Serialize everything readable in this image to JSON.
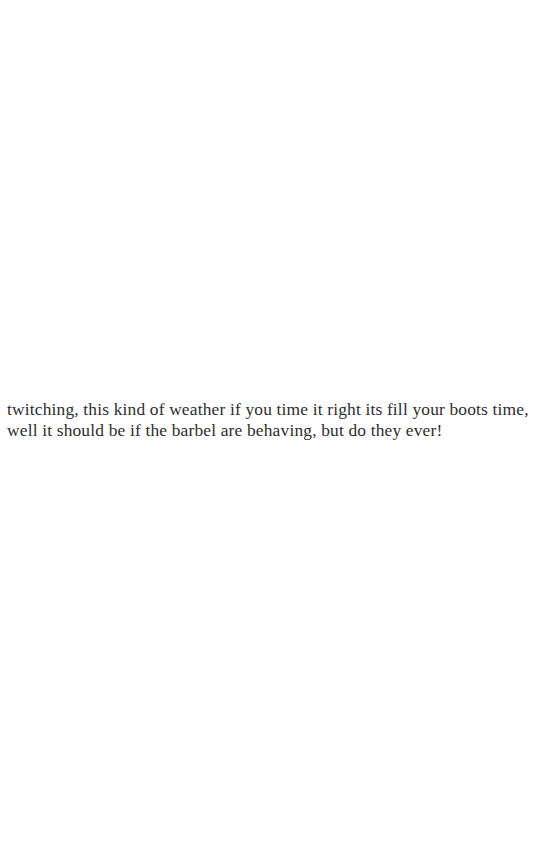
{
  "document": {
    "background_color": "#ffffff",
    "text_color": "#2e2e2e",
    "paragraph": {
      "lines": [
        "twitching, this kind of weather if you time it right its fill your boots time,",
        "well it should be if the barbel are behaving, but do they ever!"
      ],
      "full_text": "twitching, this kind of weather if you time it right its fill your boots time, well it should be if the barbel are behaving, but do they ever!"
    }
  }
}
